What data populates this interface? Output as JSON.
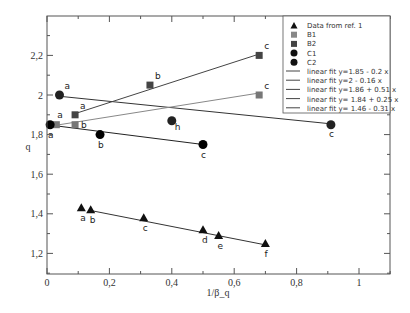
{
  "chart_data": {
    "type": "scatter",
    "title": "",
    "xlabel": "1/β_q",
    "ylabel": "q",
    "xlim": [
      0,
      1.1
    ],
    "ylim": [
      1.1,
      2.4
    ],
    "xticks": [
      {
        "v": 0,
        "label": "0"
      },
      {
        "v": 0.2,
        "label": "0,2"
      },
      {
        "v": 0.4,
        "label": "0,4"
      },
      {
        "v": 0.6,
        "label": "0,6"
      },
      {
        "v": 0.8,
        "label": "0,8"
      },
      {
        "v": 1,
        "label": "1"
      }
    ],
    "yticks": [
      {
        "v": 1.2,
        "label": "1,2"
      },
      {
        "v": 1.4,
        "label": "1,4"
      },
      {
        "v": 1.6,
        "label": "1,6"
      },
      {
        "v": 1.8,
        "label": "1,8"
      },
      {
        "v": 2,
        "label": "2"
      },
      {
        "v": 2.2,
        "label": "2,2"
      }
    ],
    "grid": false,
    "legend_position": "upper right",
    "series": [
      {
        "name": "Data from ref. 1",
        "marker": "triangle",
        "color": "#111111",
        "points": [
          {
            "x": 0.11,
            "y": 1.43,
            "label": "a"
          },
          {
            "x": 0.14,
            "y": 1.42,
            "label": "b"
          },
          {
            "x": 0.31,
            "y": 1.38,
            "label": "c"
          },
          {
            "x": 0.5,
            "y": 1.32,
            "label": "d"
          },
          {
            "x": 0.55,
            "y": 1.29,
            "label": "e"
          },
          {
            "x": 0.7,
            "y": 1.25,
            "label": "f"
          }
        ]
      },
      {
        "name": "B1",
        "marker": "square",
        "color": "#777777",
        "points": [
          {
            "x": 0.03,
            "y": 1.85,
            "label": "a"
          },
          {
            "x": 0.09,
            "y": 1.85,
            "label": "b"
          },
          {
            "x": 0.68,
            "y": 2.0,
            "label": "c"
          }
        ]
      },
      {
        "name": "B2",
        "marker": "square",
        "color": "#444444",
        "points": [
          {
            "x": 0.09,
            "y": 1.9,
            "label": "a"
          },
          {
            "x": 0.33,
            "y": 2.05,
            "label": "b"
          },
          {
            "x": 0.68,
            "y": 2.2,
            "label": "c"
          }
        ]
      },
      {
        "name": "C1",
        "marker": "circle",
        "color": "#000000",
        "points": [
          {
            "x": 0.01,
            "y": 1.85,
            "label": "a"
          },
          {
            "x": 0.17,
            "y": 1.8,
            "label": "b"
          },
          {
            "x": 0.5,
            "y": 1.75,
            "label": "c"
          }
        ]
      },
      {
        "name": "C2",
        "marker": "circle",
        "color": "#222222",
        "points": [
          {
            "x": 0.04,
            "y": 2.0,
            "label": "a"
          },
          {
            "x": 0.4,
            "y": 1.87,
            "label": "h"
          },
          {
            "x": 0.91,
            "y": 1.85,
            "label": "c"
          }
        ]
      }
    ],
    "fits": [
      {
        "name": "linear fit",
        "equation": "y=1.85 - 0.2 x",
        "intercept": 1.85,
        "slope": -0.2,
        "x_range": [
          0,
          0.5
        ],
        "color": "#222222"
      },
      {
        "name": "linear fit",
        "equation": "y=2 - 0.16 x",
        "intercept": 2.0,
        "slope": -0.16,
        "x_range": [
          0.04,
          0.91
        ],
        "color": "#333333"
      },
      {
        "name": "linear fit",
        "equation": "y=1.86 + 0.51 x",
        "intercept": 1.86,
        "slope": 0.51,
        "x_range": [
          0.09,
          0.68
        ],
        "color": "#444444"
      },
      {
        "name": "linear fit",
        "equation": "y= 1.84 + 0.25 x",
        "intercept": 1.84,
        "slope": 0.25,
        "x_range": [
          0.03,
          0.68
        ],
        "color": "#888888"
      },
      {
        "name": "linear fit",
        "equation": "y= 1.46 - 0.31 x",
        "intercept": 1.46,
        "slope": -0.31,
        "x_range": [
          0.14,
          0.7
        ],
        "color": "#333333"
      }
    ]
  },
  "legend": {
    "items": [
      {
        "label": "Data from ref. 1",
        "marker": "triangle"
      },
      {
        "label": "B1",
        "marker": "square-light"
      },
      {
        "label": "B2",
        "marker": "square-dark"
      },
      {
        "label": "C1",
        "marker": "circle"
      },
      {
        "label": "C2",
        "marker": "circle"
      },
      {
        "label": "linear fit  y=1.85 - 0.2 x",
        "marker": "line"
      },
      {
        "label": "linear fit  y=2 - 0.16 x",
        "marker": "line"
      },
      {
        "label": "linear fit  y=1.86 + 0.51 x",
        "marker": "line"
      },
      {
        "label": "linear fit  y= 1.84  + 0.25 x",
        "marker": "line"
      },
      {
        "label": "linear fit  y= 1.46 - 0.31 x",
        "marker": "line"
      }
    ]
  }
}
